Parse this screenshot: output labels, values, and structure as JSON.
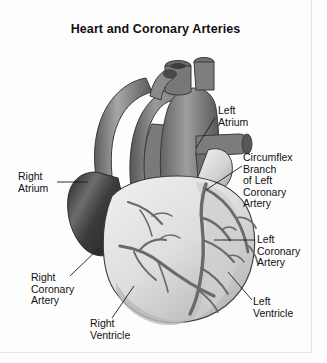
{
  "figure": {
    "title": "Heart and Coronary Arteries",
    "background_color": "#fdfdfd",
    "ink_color": "#111111",
    "style": "grayscale medical illustration"
  },
  "labels": [
    {
      "id": "left-atrium",
      "text": "Left\nAtrium"
    },
    {
      "id": "circumflex",
      "text": "Circumflex\nBranch\nof Left\nCoronary\nArtery"
    },
    {
      "id": "left-coronary",
      "text": "Left\nCoronary\nArtery"
    },
    {
      "id": "left-ventricle",
      "text": "Left\nVentricle"
    },
    {
      "id": "right-atrium",
      "text": "Right\nAtrium"
    },
    {
      "id": "right-coronary",
      "text": "Right\nCoronary\nArtery"
    },
    {
      "id": "right-ventricle",
      "text": "Right\nVentricle"
    }
  ],
  "anatomy": {
    "vessel_dark": "#6f6f6f",
    "vessel_mid": "#8c8c8c",
    "vessel_light": "#b4b4b4",
    "ventricle_light": "#d8d8d8",
    "ventricle_mid": "#c4c4c4",
    "atrium_dark": "#4a4a4a",
    "coronary_artery": "#6a6a6a",
    "outline": "#3a3a3a"
  }
}
